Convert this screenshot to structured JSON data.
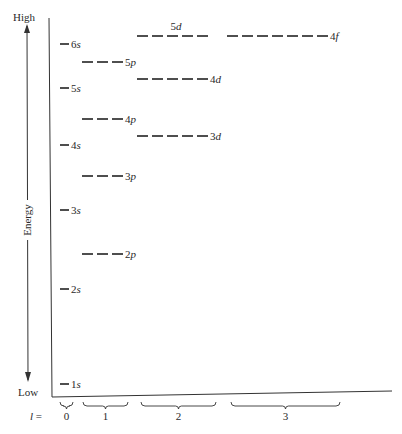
{
  "figure": {
    "axis": {
      "high_label": "High",
      "low_label": "Low",
      "energy_label": "Energy",
      "l_label": "l =",
      "line_color": "#333333"
    },
    "l_groups": [
      {
        "value": "0",
        "x1": 60,
        "x2": 73
      },
      {
        "value": "1",
        "x1": 83,
        "x2": 128
      },
      {
        "value": "2",
        "x1": 141,
        "x2": 216
      },
      {
        "value": "3",
        "x1": 231,
        "x2": 340
      }
    ],
    "levels": [
      {
        "n": "1",
        "sub": "s",
        "l": 0,
        "y": 384,
        "x": 60,
        "dashes": 1
      },
      {
        "n": "2",
        "sub": "s",
        "l": 0,
        "y": 289,
        "x": 60,
        "dashes": 1
      },
      {
        "n": "3",
        "sub": "s",
        "l": 0,
        "y": 210,
        "x": 60,
        "dashes": 1
      },
      {
        "n": "4",
        "sub": "s",
        "l": 0,
        "y": 145,
        "x": 60,
        "dashes": 1
      },
      {
        "n": "5",
        "sub": "s",
        "l": 0,
        "y": 88,
        "x": 60,
        "dashes": 1
      },
      {
        "n": "6",
        "sub": "s",
        "l": 0,
        "y": 44,
        "x": 60,
        "dashes": 1
      },
      {
        "n": "2",
        "sub": "p",
        "l": 1,
        "y": 254,
        "x": 82,
        "dashes": 3
      },
      {
        "n": "3",
        "sub": "p",
        "l": 1,
        "y": 176,
        "x": 82,
        "dashes": 3
      },
      {
        "n": "4",
        "sub": "p",
        "l": 1,
        "y": 119,
        "x": 82,
        "dashes": 3
      },
      {
        "n": "5",
        "sub": "p",
        "l": 1,
        "y": 62,
        "x": 82,
        "dashes": 3
      },
      {
        "n": "3",
        "sub": "d",
        "l": 2,
        "y": 136,
        "x": 137,
        "dashes": 5
      },
      {
        "n": "4",
        "sub": "d",
        "l": 2,
        "y": 79,
        "x": 137,
        "dashes": 5
      },
      {
        "n": "5",
        "sub": "d",
        "l": 2,
        "y": 36,
        "x": 137,
        "dashes": 5,
        "label_above": true
      },
      {
        "n": "4",
        "sub": "f",
        "l": 3,
        "y": 36,
        "x": 227,
        "dashes": 7
      }
    ]
  }
}
